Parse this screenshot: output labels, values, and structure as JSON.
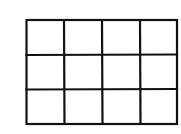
{
  "grid": {
    "rows": 3,
    "columns": 4,
    "line_color": "#111111",
    "background": "#ffffff",
    "bounds": {
      "left": 26,
      "top": 20,
      "right": 177,
      "bottom": 124
    },
    "column_lines": [
      26,
      64,
      102,
      140,
      177
    ],
    "row_lines": [
      20,
      55,
      89,
      124
    ]
  }
}
